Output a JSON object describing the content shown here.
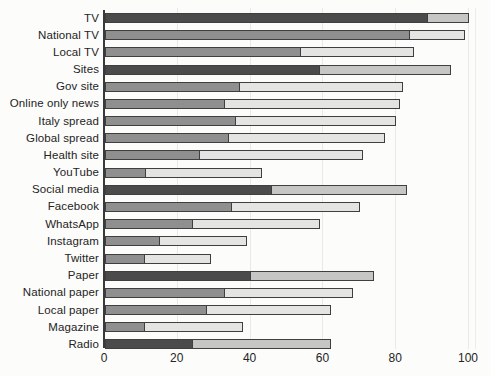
{
  "figure": {
    "background_color": "#fcfcfb",
    "text_color": "#242424"
  },
  "chart_data": {
    "type": "bar",
    "orientation": "horizontal",
    "stacked": true,
    "title": "",
    "xlabel": "",
    "ylabel": "",
    "xlim": [
      0,
      100
    ],
    "x_ticks": [
      "0",
      "20",
      "40",
      "60",
      "80",
      "100"
    ],
    "grid": "vertical light gridlines at each x tick",
    "legend": "none",
    "categories": [
      "TV",
      "National TV",
      "Local TV",
      "Sites",
      "Gov site",
      "Online only news",
      "Italy spread",
      "Global spread",
      "Health site",
      "YouTube",
      "Social media",
      "Facebook",
      "WhatsApp",
      "Instagram",
      "Twitter",
      "Paper",
      "National paper",
      "Local paper",
      "Magazine",
      "Radio"
    ],
    "series": [
      {
        "name": "dark segment (first stack value)",
        "values": [
          89,
          84,
          54,
          59,
          37,
          33,
          36,
          34,
          26,
          11,
          46,
          35,
          24,
          15,
          11,
          40,
          33,
          28,
          11,
          24
        ]
      },
      {
        "name": "light segment (stack extends to total)",
        "values": [
          11,
          15,
          31,
          36,
          45,
          48,
          44,
          43,
          45,
          32,
          37,
          35,
          35,
          24,
          18,
          34,
          35,
          34,
          27,
          38
        ]
      }
    ],
    "totals": [
      100,
      99,
      85,
      95,
      82,
      81,
      80,
      77,
      71,
      43,
      83,
      70,
      59,
      39,
      29,
      74,
      68,
      62,
      38,
      62
    ],
    "emphasized_rows": [
      "TV",
      "Sites",
      "Social media",
      "Paper",
      "Radio"
    ],
    "colors": {
      "primary_emphasis": "#4b4b4b",
      "secondary_emphasis": "#c6c6c5",
      "primary_normal": "#8f8f8f",
      "secondary_normal": "#e4e4e2",
      "bar_border": "#3f3f3f",
      "gridline": "#e9e9e6",
      "axis_line": "#3a3a3a"
    }
  }
}
